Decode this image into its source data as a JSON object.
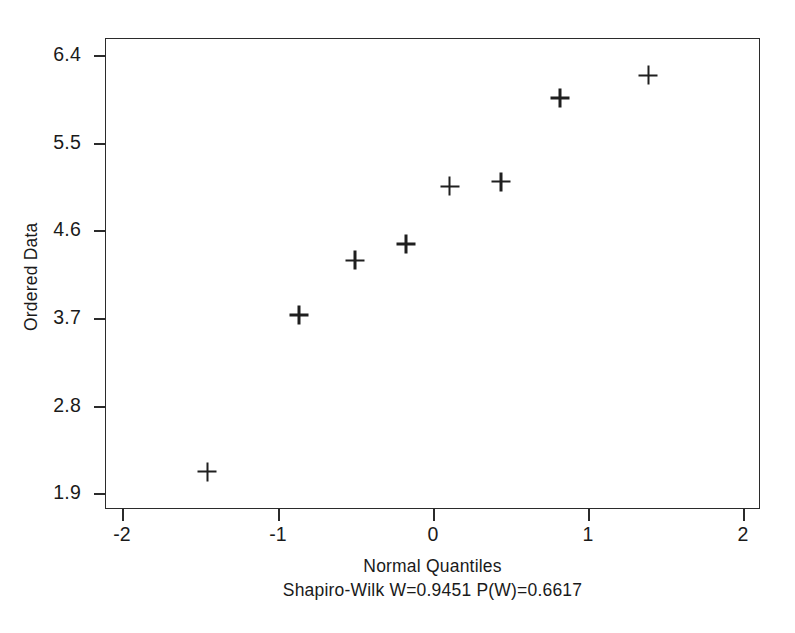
{
  "chart_data": {
    "type": "scatter",
    "title": "",
    "xlabel": "Normal Quantiles",
    "ylabel": "Ordered Data",
    "xlim": [
      -2.2,
      2.0
    ],
    "ylim": [
      1.68,
      6.58
    ],
    "xticks": [
      -2,
      -1,
      0,
      1,
      2
    ],
    "xtick_labels": [
      "-2",
      "-1",
      "0",
      "1",
      "2"
    ],
    "yticks": [
      6.4,
      5.5,
      4.6,
      3.7,
      2.8,
      1.9
    ],
    "ytick_labels": [
      "6.4",
      "5.5",
      "4.6",
      "3.7",
      "2.8",
      "1.9"
    ],
    "grid": false,
    "legend": null,
    "marker": "plus",
    "marker_color": "#1f1f1f",
    "n_points": 8,
    "x": [
      -1.45,
      -0.86,
      -0.5,
      -0.17,
      0.11,
      0.44,
      0.82,
      1.39
    ],
    "y": [
      2.12,
      3.73,
      4.29,
      4.46,
      5.05,
      5.1,
      5.96,
      6.19
    ],
    "points": [
      {
        "x": -1.45,
        "y": 2.12
      },
      {
        "x": -0.86,
        "y": 3.73
      },
      {
        "x": -0.5,
        "y": 4.29
      },
      {
        "x": -0.17,
        "y": 4.46
      },
      {
        "x": 0.11,
        "y": 5.05
      },
      {
        "x": 0.44,
        "y": 5.1
      },
      {
        "x": 0.82,
        "y": 5.96
      },
      {
        "x": 1.39,
        "y": 6.19
      }
    ],
    "annotations": [
      "Shapiro-Wilk W=0.9451  P(W)=0.6617"
    ],
    "statistics": {
      "test_name": "Shapiro-Wilk",
      "W": 0.9451,
      "P_W": 0.6617,
      "caption": "Shapiro-Wilk W=0.9451  P(W)=0.6617"
    }
  },
  "figure": {
    "background_color": "#ffffff",
    "axis_color": "#2b2b2b",
    "text_color": "#1a1a1a"
  }
}
